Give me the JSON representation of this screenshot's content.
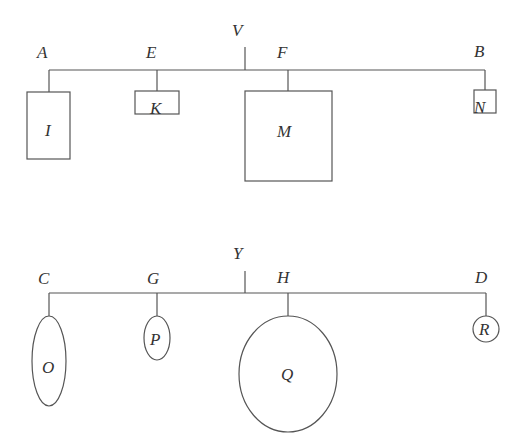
{
  "diagram": {
    "top": {
      "pivot_label": "V",
      "beam": {
        "x1": 49,
        "x2": 485,
        "y": 70
      },
      "pivot": {
        "x": 245,
        "y1": 47,
        "y2": 70,
        "label_x": 238,
        "label_y": 36
      },
      "points": [
        {
          "label": "A",
          "x": 49,
          "shape": "rect",
          "shape_label": "I",
          "box": {
            "x": 27,
            "y": 92,
            "w": 43,
            "h": 67
          }
        },
        {
          "label": "E",
          "x": 157,
          "shape": "rect",
          "shape_label": "K",
          "box": {
            "x": 135,
            "y": 91,
            "w": 44,
            "h": 23
          }
        },
        {
          "label": "F",
          "x": 288,
          "shape": "rect",
          "shape_label": "M",
          "box": {
            "x": 245,
            "y": 91,
            "w": 87,
            "h": 90
          }
        },
        {
          "label": "B",
          "x": 485,
          "shape": "rect",
          "shape_label": "N",
          "box": {
            "x": 474,
            "y": 90,
            "w": 22,
            "h": 23
          }
        }
      ]
    },
    "bottom": {
      "pivot_label": "Y",
      "beam": {
        "x1": 49,
        "x2": 486,
        "y": 293
      },
      "pivot": {
        "x": 245,
        "y1": 271,
        "y2": 293,
        "label_x": 239,
        "label_y": 259
      },
      "points": [
        {
          "label": "C",
          "x": 49,
          "shape": "ellipse",
          "shape_label": "O",
          "ellipse": {
            "cx": 49,
            "cy": 361,
            "rx": 17,
            "ry": 45
          }
        },
        {
          "label": "G",
          "x": 157,
          "shape": "ellipse",
          "shape_label": "P",
          "ellipse": {
            "cx": 157,
            "cy": 338,
            "rx": 13,
            "ry": 22
          }
        },
        {
          "label": "H",
          "x": 288,
          "shape": "ellipse",
          "shape_label": "Q",
          "ellipse": {
            "cx": 288,
            "cy": 374,
            "rx": 49,
            "ry": 58
          }
        },
        {
          "label": "D",
          "x": 485,
          "shape": "circle",
          "shape_label": "R",
          "ellipse": {
            "cx": 485,
            "cy": 329,
            "rx": 13,
            "ry": 13
          }
        }
      ]
    },
    "colors": {
      "stroke": "#555555",
      "text": "#333333",
      "background": "#ffffff"
    }
  },
  "labels": {
    "V": "V",
    "A": "A",
    "E": "E",
    "F": "F",
    "B": "B",
    "I": "I",
    "K": "K",
    "M": "M",
    "N": "N",
    "Y": "Y",
    "C": "C",
    "G": "G",
    "H": "H",
    "D": "D",
    "O": "O",
    "P": "P",
    "Q": "Q",
    "R": "R"
  }
}
